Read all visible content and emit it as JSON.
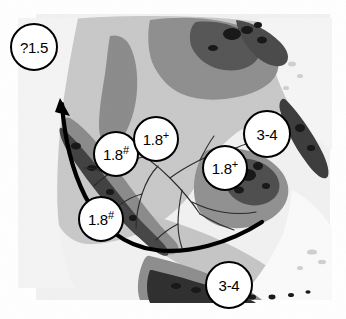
{
  "figure": {
    "type": "map",
    "title": "",
    "region_description": "Greyscale shaded-relief map of Sundaland / Southeast Asia with radiometric age annotations and a dispersal arrow",
    "background_color": "#ffffff",
    "map_palette": {
      "sea": "#f2f2f2",
      "lowland": "#c9c9c9",
      "midland": "#9a9a9a",
      "upland": "#6f6f6f",
      "highland": "#3d3d3d",
      "peak": "#1a1a1a",
      "outline": "#000000"
    }
  },
  "annotations": {
    "label_circle_color": "#ffffff",
    "label_border_color": "#000000",
    "items": [
      {
        "id": "lbl-q15",
        "value": "?1.5",
        "superscript": "",
        "x": 10,
        "y": 23,
        "d": 48
      },
      {
        "id": "lbl-18a",
        "value": "1.8",
        "superscript": "#",
        "x": 93,
        "y": 131,
        "d": 46
      },
      {
        "id": "lbl-18b",
        "value": "1.8",
        "superscript": "+",
        "x": 133,
        "y": 116,
        "d": 46
      },
      {
        "id": "lbl-18c",
        "value": "1.8",
        "superscript": "+",
        "x": 202,
        "y": 145,
        "d": 46
      },
      {
        "id": "lbl-34a",
        "value": "3-4",
        "superscript": "",
        "x": 243,
        "y": 110,
        "d": 48
      },
      {
        "id": "lbl-18d",
        "value": "1.8",
        "superscript": "#",
        "x": 78,
        "y": 196,
        "d": 46
      },
      {
        "id": "lbl-34b",
        "value": "3-4",
        "superscript": "",
        "x": 205,
        "y": 261,
        "d": 48
      }
    ]
  },
  "arrow": {
    "name": "dispersal-arrow",
    "color": "#000000",
    "stroke_width": 4.2,
    "description": "Thick curved arrow sweeping westward from the eastern margin, looping south then turning north-west with an arrowhead at the upper left",
    "head_direction": "north-west"
  },
  "rivers": {
    "name": "river-network",
    "color": "#2b2b2b",
    "stroke_width": 1.1,
    "description": "Dendritic palaeo-river drainage network across the exposed Sunda shelf"
  }
}
